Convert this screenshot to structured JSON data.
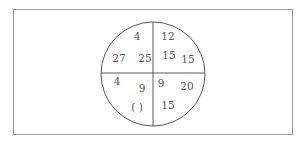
{
  "diagram": {
    "type": "number-circle-puzzle",
    "quadrants": {
      "top_left": [
        {
          "id": "tl1",
          "value": "4",
          "x": 137,
          "y": 36
        },
        {
          "id": "tl2",
          "value": "27",
          "x": 119,
          "y": 58
        },
        {
          "id": "tl3",
          "value": "25",
          "x": 145,
          "y": 58
        }
      ],
      "top_right": [
        {
          "id": "tr1",
          "value": "12",
          "x": 168,
          "y": 36
        },
        {
          "id": "tr2",
          "value": "15",
          "x": 169,
          "y": 55
        },
        {
          "id": "tr3",
          "value": "15",
          "x": 188,
          "y": 59
        }
      ],
      "bottom_left": [
        {
          "id": "bl1",
          "value": "4",
          "x": 117,
          "y": 81
        },
        {
          "id": "bl2",
          "value": "9",
          "x": 142,
          "y": 88
        },
        {
          "id": "bl3",
          "value": "(   )",
          "x": 137,
          "y": 107
        }
      ],
      "bottom_right": [
        {
          "id": "br1",
          "value": "9",
          "x": 161,
          "y": 83
        },
        {
          "id": "br2",
          "value": "20",
          "x": 187,
          "y": 86
        },
        {
          "id": "br3",
          "value": "15",
          "x": 168,
          "y": 105
        }
      ]
    },
    "circle": {
      "cx": 153,
      "cy": 74,
      "r": 52
    },
    "colors": {
      "line": "#5a5a5a",
      "frame": "#9a9a9a",
      "text": "#555555"
    }
  }
}
